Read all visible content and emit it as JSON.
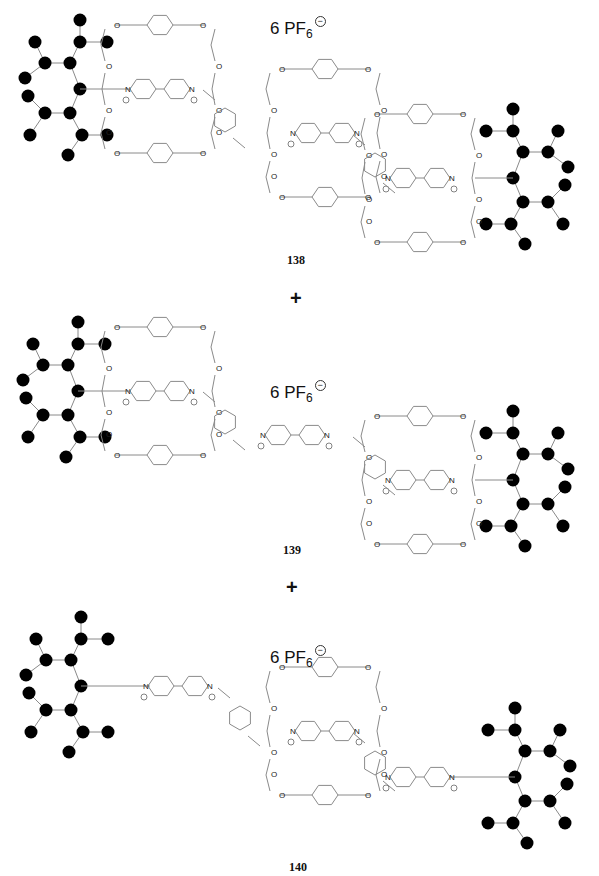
{
  "figure": {
    "compounds": [
      {
        "id": "138",
        "label": "138",
        "label_pos": [
          287,
          253
        ],
        "counterion": {
          "prefix": "6 PF",
          "subscript": "6",
          "charge": "−",
          "pos": [
            270,
            16
          ]
        },
        "stoppers": [
          {
            "side": "left",
            "center": [
              80,
              89
            ]
          },
          {
            "side": "right",
            "center": [
              513,
              178
            ]
          }
        ],
        "axle_segments": [
          [
            80,
            89,
            130,
            89
          ],
          [
            475,
            178,
            513,
            178
          ]
        ],
        "rings": [
          [
            160,
            89
          ],
          [
            325,
            133
          ],
          [
            420,
            178
          ]
        ],
        "free_bipyridiniums": [],
        "linkers": [
          [
            225,
            120
          ],
          [
            375,
            165
          ]
        ]
      },
      {
        "id": "139",
        "label": "139",
        "label_pos": [
          283,
          543
        ],
        "counterion": {
          "prefix": "6 PF",
          "subscript": "6",
          "charge": "−",
          "pos": [
            270,
            380
          ]
        },
        "stoppers": [
          {
            "side": "left",
            "center": [
              78,
              391
            ]
          },
          {
            "side": "right",
            "center": [
              513,
              480
            ]
          }
        ],
        "axle_segments": [
          [
            78,
            391,
            130,
            391
          ],
          [
            475,
            480,
            513,
            480
          ]
        ],
        "rings": [
          [
            160,
            391
          ],
          [
            420,
            480
          ]
        ],
        "free_bipyridiniums": [
          [
            295,
            435
          ]
        ],
        "linkers": [
          [
            225,
            422
          ],
          [
            375,
            467
          ]
        ]
      },
      {
        "id": "140",
        "label": "140",
        "label_pos": [
          289,
          860
        ],
        "counterion": {
          "prefix": "6 PF",
          "subscript": "6",
          "charge": "−",
          "pos": [
            270,
            645
          ]
        },
        "stoppers": [
          {
            "side": "left",
            "center": [
              81,
              686
            ]
          },
          {
            "side": "right",
            "center": [
              515,
              777
            ]
          }
        ],
        "axle_segments": [
          [
            81,
            686,
            150,
            686
          ],
          [
            450,
            777,
            515,
            777
          ]
        ],
        "rings": [
          [
            325,
            731
          ]
        ],
        "free_bipyridiniums": [
          [
            178,
            686
          ],
          [
            420,
            777
          ]
        ],
        "linkers": [
          [
            240,
            718
          ],
          [
            375,
            763
          ]
        ]
      }
    ],
    "operators": [
      {
        "symbol": "+",
        "pos": [
          290,
          288
        ]
      },
      {
        "symbol": "+",
        "pos": [
          286,
          577
        ]
      }
    ],
    "atom_labels": {
      "oxygen": "O",
      "nitrogen": "N",
      "positive_charge": "+"
    },
    "colors": {
      "bond": "#8a8a8a",
      "dendron_node": "#000000",
      "text": "#111111"
    }
  }
}
